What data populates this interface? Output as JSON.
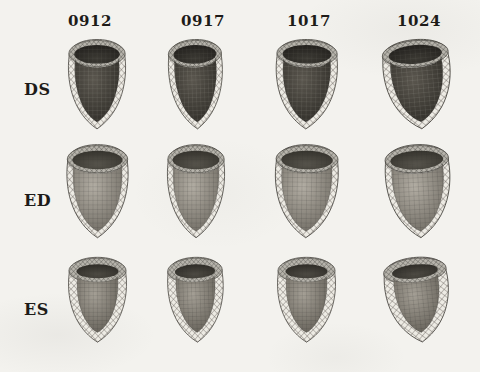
{
  "figure": {
    "columns": [
      "0912",
      "0917",
      "1017",
      "1024"
    ],
    "rows": [
      "DS",
      "ED",
      "ES"
    ],
    "cells": [
      {
        "row": "DS",
        "col": "0912"
      },
      {
        "row": "DS",
        "col": "0917"
      },
      {
        "row": "DS",
        "col": "1017"
      },
      {
        "row": "DS",
        "col": "1024"
      },
      {
        "row": "ED",
        "col": "0912"
      },
      {
        "row": "ED",
        "col": "0917"
      },
      {
        "row": "ED",
        "col": "1017"
      },
      {
        "row": "ED",
        "col": "1024"
      },
      {
        "row": "ES",
        "col": "0912"
      },
      {
        "row": "ES",
        "col": "0917"
      },
      {
        "row": "ES",
        "col": "1017"
      },
      {
        "row": "ES",
        "col": "1024"
      }
    ]
  },
  "colors": {
    "paper": "#f3f2ee",
    "label_text": "#1d1b18",
    "outline": "#3a3832",
    "mesh_bg": "#edebe4",
    "mesh_line": "#54514a",
    "rim_bg": "#b7b4ac",
    "rim_line": "#403e38"
  },
  "row_styles": {
    "DS": {
      "inner_hi": "#5a564e",
      "inner_lo": "#2d2b26",
      "cavity_hi": "#3b3933",
      "cavity_lo": "#211f1c",
      "grid_line": "rgba(205,202,192,0.30)"
    },
    "ED": {
      "inner_hi": "#b2ada3",
      "inner_lo": "#6d6961",
      "cavity_hi": "#57544c",
      "cavity_lo": "#34322c",
      "grid_line": "rgba(28,27,23,0.38)"
    },
    "ES": {
      "inner_hi": "#a49f95",
      "inner_lo": "#615d55",
      "cavity_hi": "#4d4a43",
      "cavity_lo": "#2e2c27",
      "grid_line": "rgba(28,27,23,0.38)"
    }
  }
}
